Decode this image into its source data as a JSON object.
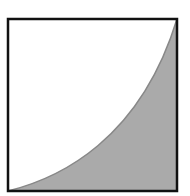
{
  "diagram": {
    "shape": "square-with-convex-curve",
    "colors": {
      "border": "#111111",
      "fill": "#aaaaaa",
      "background": "#ffffff",
      "curve": "#888888"
    }
  }
}
